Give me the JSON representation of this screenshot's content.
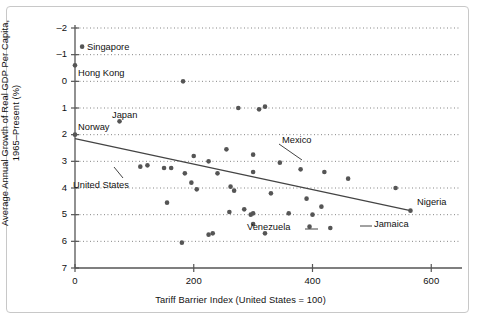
{
  "chart_data": {
    "type": "scatter",
    "title": "",
    "xlabel": "Tariff Barrier Index (United States = 100)",
    "ylabel_line1": "Average Annual Growth of Real GDP Per Capita,",
    "ylabel_line2": "1965–Present (%)",
    "xlim": [
      0,
      640
    ],
    "ylim": [
      -2,
      7
    ],
    "xticks": [
      0,
      200,
      400,
      600
    ],
    "yticks": [
      -2,
      -1,
      0,
      1,
      2,
      3,
      4,
      5,
      6,
      7
    ],
    "grid": "horizontal-dotted",
    "legend": "none",
    "marker_color": "#555555",
    "line_color": "#444444",
    "grid_color": "#666666",
    "axis_color": "#555555",
    "trendline": {
      "x0": 0,
      "y0": 2.85,
      "x1": 565,
      "y1": 0.15
    },
    "points": [
      {
        "x": 12,
        "y": 6.3,
        "label": "Singapore"
      },
      {
        "x": 0,
        "y": 5.6,
        "label": "Hong Kong"
      },
      {
        "x": 182,
        "y": 5.0,
        "label": ""
      },
      {
        "x": 75,
        "y": 3.5,
        "label": "Japan"
      },
      {
        "x": 0,
        "y": 3.0,
        "label": "Norway"
      },
      {
        "x": 275,
        "y": 4.0,
        "label": ""
      },
      {
        "x": 310,
        "y": 3.95,
        "label": ""
      },
      {
        "x": 320,
        "y": 4.05,
        "label": ""
      },
      {
        "x": 255,
        "y": 2.45,
        "label": ""
      },
      {
        "x": 300,
        "y": 2.25,
        "label": ""
      },
      {
        "x": 200,
        "y": 2.2,
        "label": ""
      },
      {
        "x": 225,
        "y": 2.0,
        "label": ""
      },
      {
        "x": 345,
        "y": 1.95,
        "label": ""
      },
      {
        "x": 380,
        "y": 1.7,
        "label": ""
      },
      {
        "x": 110,
        "y": 1.8,
        "label": "United States"
      },
      {
        "x": 122,
        "y": 1.85,
        "label": ""
      },
      {
        "x": 150,
        "y": 1.75,
        "label": ""
      },
      {
        "x": 162,
        "y": 1.75,
        "label": ""
      },
      {
        "x": 185,
        "y": 1.55,
        "label": ""
      },
      {
        "x": 240,
        "y": 1.55,
        "label": ""
      },
      {
        "x": 300,
        "y": 1.6,
        "label": "Mexico"
      },
      {
        "x": 420,
        "y": 1.6,
        "label": ""
      },
      {
        "x": 460,
        "y": 1.35,
        "label": ""
      },
      {
        "x": 540,
        "y": 1.0,
        "label": ""
      },
      {
        "x": 196,
        "y": 1.2,
        "label": ""
      },
      {
        "x": 262,
        "y": 1.05,
        "label": ""
      },
      {
        "x": 268,
        "y": 0.9,
        "label": ""
      },
      {
        "x": 205,
        "y": 0.95,
        "label": ""
      },
      {
        "x": 330,
        "y": 0.8,
        "label": ""
      },
      {
        "x": 390,
        "y": 0.6,
        "label": ""
      },
      {
        "x": 155,
        "y": 0.45,
        "label": ""
      },
      {
        "x": 260,
        "y": 0.1,
        "label": ""
      },
      {
        "x": 285,
        "y": 0.2,
        "label": ""
      },
      {
        "x": 296,
        "y": 0.0,
        "label": ""
      },
      {
        "x": 300,
        "y": 0.05,
        "label": ""
      },
      {
        "x": 360,
        "y": 0.05,
        "label": ""
      },
      {
        "x": 400,
        "y": 0.0,
        "label": ""
      },
      {
        "x": 415,
        "y": 0.3,
        "label": ""
      },
      {
        "x": 565,
        "y": 0.15,
        "label": "Nigeria"
      },
      {
        "x": 300,
        "y": -0.35,
        "label": ""
      },
      {
        "x": 395,
        "y": -0.45,
        "label": ""
      },
      {
        "x": 430,
        "y": -0.5,
        "label": "Jamaica"
      },
      {
        "x": 225,
        "y": -0.75,
        "label": ""
      },
      {
        "x": 232,
        "y": -0.7,
        "label": ""
      },
      {
        "x": 320,
        "y": -0.7,
        "label": "Venezuela"
      },
      {
        "x": 180,
        "y": -1.05,
        "label": ""
      }
    ],
    "annotations": [
      {
        "text": "Singapore",
        "anchor": "right",
        "x": 12,
        "y": 6.3
      },
      {
        "text": "Hong Kong",
        "anchor": "right",
        "x": 0,
        "y": 5.6
      },
      {
        "text": "Japan",
        "anchor": "right",
        "x": 75,
        "y": 3.5
      },
      {
        "text": "Norway",
        "anchor": "right",
        "x": 0,
        "y": 3.0
      },
      {
        "text": "United States",
        "anchor": "leader-up",
        "x": 110,
        "y": 1.8
      },
      {
        "text": "Mexico",
        "anchor": "leader-left",
        "x": 300,
        "y": 1.6
      },
      {
        "text": "Venezuela",
        "anchor": "leader-left",
        "x": 320,
        "y": -0.7
      },
      {
        "text": "Jamaica",
        "anchor": "leader-left",
        "x": 430,
        "y": -0.5
      },
      {
        "text": "Nigeria",
        "anchor": "above",
        "x": 565,
        "y": 0.15
      }
    ]
  },
  "axis": {
    "ytick_labels": [
      "7",
      "6",
      "5",
      "4",
      "3",
      "2",
      "1",
      "0",
      "–1",
      "–2"
    ],
    "xtick_labels": [
      "0",
      "200",
      "400",
      "600"
    ]
  }
}
